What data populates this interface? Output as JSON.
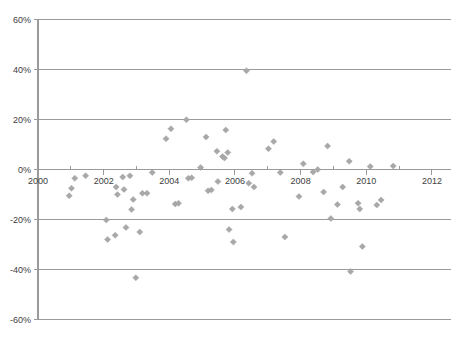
{
  "chart": {
    "type": "scatter",
    "title": "",
    "marker_color": "#a8a8a8",
    "axis_color": "#9a9a9a",
    "label_color": "#404040"
  },
  "chart_data": {
    "type": "scatter",
    "title": "",
    "subtitle": "",
    "xlabel": "",
    "ylabel": "",
    "xlim": [
      2000,
      2012
    ],
    "ylim": [
      -60,
      60
    ],
    "grid": true,
    "legend": "none",
    "x_tick_labels": [
      "2000",
      "2002",
      "2004",
      "2006",
      "2008",
      "2010",
      "2012"
    ],
    "x_tick_values": [
      2000,
      2002,
      2004,
      2006,
      2008,
      2010,
      2012
    ],
    "x_minor_tick_values": [
      2001,
      2003,
      2005,
      2007,
      2009,
      2011
    ],
    "y_tick_labels": [
      "60%",
      "40%",
      "20%",
      "0%",
      "-20%",
      "-40%",
      "-60%"
    ],
    "y_tick_values": [
      60,
      40,
      20,
      0,
      -20,
      -40,
      -60
    ],
    "series": [
      {
        "name": "observations",
        "marker": "diamond",
        "color": "#a8a8a8",
        "points": [
          [
            2001.12,
            -3.5
          ],
          [
            2001.02,
            -7.5
          ],
          [
            2000.95,
            -10.5
          ],
          [
            2001.45,
            -2.5
          ],
          [
            2002.08,
            -20.2
          ],
          [
            2002.12,
            -28.0
          ],
          [
            2002.35,
            -26.3
          ],
          [
            2002.38,
            -7.0
          ],
          [
            2002.42,
            -10.0
          ],
          [
            2002.58,
            -3.0
          ],
          [
            2002.62,
            -8.0
          ],
          [
            2002.68,
            -23.2
          ],
          [
            2002.8,
            -2.5
          ],
          [
            2002.85,
            -16.0
          ],
          [
            2002.9,
            -12.0
          ],
          [
            2002.98,
            -43.3
          ],
          [
            2003.1,
            -25.0
          ],
          [
            2003.18,
            -9.5
          ],
          [
            2003.32,
            -9.5
          ],
          [
            2003.48,
            -1.2
          ],
          [
            2003.9,
            12.3
          ],
          [
            2004.05,
            16.3
          ],
          [
            2004.18,
            -13.8
          ],
          [
            2004.28,
            -13.5
          ],
          [
            2004.52,
            19.9
          ],
          [
            2004.58,
            -3.5
          ],
          [
            2004.68,
            -3.3
          ],
          [
            2004.95,
            0.8
          ],
          [
            2005.12,
            13.0
          ],
          [
            2005.18,
            -8.5
          ],
          [
            2005.28,
            -8.2
          ],
          [
            2005.45,
            7.3
          ],
          [
            2005.48,
            -4.8
          ],
          [
            2005.62,
            5.2
          ],
          [
            2005.68,
            4.6
          ],
          [
            2005.72,
            15.8
          ],
          [
            2005.78,
            6.8
          ],
          [
            2005.82,
            -24.0
          ],
          [
            2005.92,
            -15.8
          ],
          [
            2005.95,
            -29.0
          ],
          [
            2006.18,
            -15.0
          ],
          [
            2006.35,
            39.5
          ],
          [
            2006.42,
            -5.5
          ],
          [
            2006.52,
            -1.5
          ],
          [
            2006.58,
            -7.0
          ],
          [
            2007.02,
            8.3
          ],
          [
            2007.18,
            11.2
          ],
          [
            2007.38,
            -1.2
          ],
          [
            2007.52,
            -27.0
          ],
          [
            2007.95,
            -10.8
          ],
          [
            2008.08,
            2.3
          ],
          [
            2008.38,
            -1.0
          ],
          [
            2008.52,
            0.0
          ],
          [
            2008.7,
            -9.0
          ],
          [
            2008.82,
            9.4
          ],
          [
            2008.92,
            -19.6
          ],
          [
            2009.12,
            -14.0
          ],
          [
            2009.28,
            -7.0
          ],
          [
            2009.48,
            3.3
          ],
          [
            2009.52,
            -40.8
          ],
          [
            2009.75,
            -13.5
          ],
          [
            2009.8,
            -15.8
          ],
          [
            2009.88,
            -30.8
          ],
          [
            2010.12,
            1.2
          ],
          [
            2010.32,
            -14.2
          ],
          [
            2010.45,
            -12.2
          ],
          [
            2010.82,
            1.4
          ]
        ]
      }
    ]
  }
}
